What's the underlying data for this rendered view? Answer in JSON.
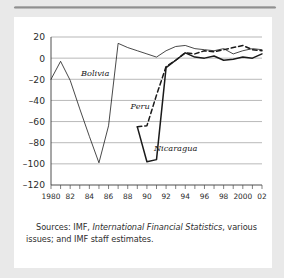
{
  "card": {
    "source_note_prefix": "Sources: IMF, ",
    "source_note_italic": "International Financial Statistics",
    "source_note_suffix": ", various issues; and IMF staff estimates."
  },
  "chart_data": {
    "type": "line",
    "title": "",
    "xlabel": "",
    "ylabel": "",
    "xlim": [
      1980,
      2002
    ],
    "ylim": [
      -120,
      20
    ],
    "grid": true,
    "legend": "inline-annotations",
    "y_ticks": [
      20,
      0,
      -20,
      -40,
      -60,
      -80,
      -100,
      -120
    ],
    "y_tick_labels": [
      "20",
      "0",
      "–20",
      "–40",
      "–60",
      "–80",
      "–100",
      "–120"
    ],
    "x_ticks": [
      1980,
      1981,
      1982,
      1983,
      1984,
      1985,
      1986,
      1987,
      1988,
      1989,
      1990,
      1991,
      1992,
      1993,
      1994,
      1995,
      1996,
      1997,
      1998,
      1999,
      2000,
      2001,
      2002
    ],
    "x_tick_labels": [
      "1980",
      "",
      "82",
      "",
      "84",
      "",
      "86",
      "",
      "88",
      "",
      "90",
      "",
      "92",
      "",
      "94",
      "",
      "96",
      "",
      "98",
      "",
      "2000",
      "",
      "02"
    ],
    "series": [
      {
        "name": "Bolivia",
        "style": "solid",
        "color": "#3a3a3a",
        "width": 0.8,
        "label_x": 1984.6,
        "label_y": -17,
        "x": [
          1980,
          1981,
          1982,
          1983,
          1984,
          1985,
          1986,
          1987,
          1988,
          1989,
          1990,
          1991,
          1992,
          1993,
          1994,
          1995,
          1996,
          1997,
          1998,
          1999,
          2000,
          2001,
          2002
        ],
        "y": [
          -20,
          -3,
          -21,
          -48,
          -74,
          -99,
          -64,
          14,
          10,
          7,
          4,
          1,
          7,
          11,
          12,
          9,
          8,
          7,
          9,
          4,
          7,
          9,
          8
        ]
      },
      {
        "name": "Peru",
        "style": "dashed",
        "color": "#1a1a1a",
        "width": 1.5,
        "label_x": 1989.3,
        "label_y": -48,
        "x": [
          1989,
          1990,
          1991,
          1992,
          1993,
          1994,
          1995,
          1996,
          1997,
          1998,
          1999,
          2000,
          2001,
          2002
        ],
        "y": [
          -65,
          -64,
          -35,
          -8,
          -2,
          5,
          4,
          7,
          6,
          8,
          10,
          12,
          8,
          7
        ]
      },
      {
        "name": "Nicaragua",
        "style": "solid",
        "color": "#1a1a1a",
        "width": 1.5,
        "label_x": 1993.0,
        "label_y": -88,
        "x": [
          1989,
          1990,
          1991,
          1992,
          1993,
          1994,
          1995,
          1996,
          1997,
          1998,
          1999,
          2000,
          2001,
          2002
        ],
        "y": [
          -65,
          -98,
          -96,
          -9,
          -2,
          5,
          1,
          0,
          2,
          -2,
          -1,
          1,
          0,
          4
        ]
      }
    ]
  }
}
